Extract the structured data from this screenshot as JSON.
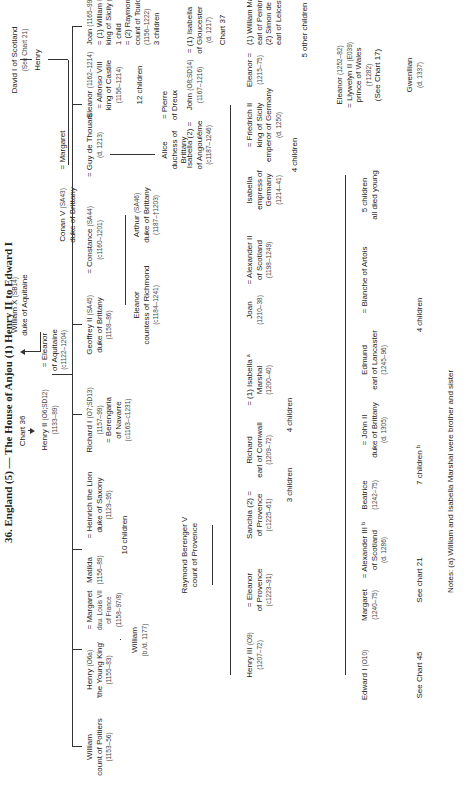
{
  "title": "36. England (5) — The House of Anjou (1) Henry II to Edward I",
  "cross_refs": {
    "chart36": "Chart 36",
    "chart37": "Chart 37",
    "chart21": "See chart 21",
    "chart45": "See Chart 45",
    "chart17": "(See Chart 17)",
    "see_chart21_david": "(See Chart 21)"
  },
  "gen0": {
    "william_x": {
      "name": "William X",
      "ref": "(SB14)",
      "title": "duke of Aquitaine"
    },
    "david_i": {
      "name": "David I of Scotland"
    },
    "henry_scot": {
      "name": "Henry"
    },
    "henry_ii": {
      "name": "Henry II",
      "ref": "(O6;SD12)",
      "dates": "(1133–89)"
    },
    "eleanor_aq": {
      "name": "= Eleanor",
      "title": "of Aquitaine",
      "dates": "(c1122–1204)"
    },
    "conan_iv": {
      "name": "Conan V",
      "ref": "(SA43)",
      "title": "duke of Brittany"
    },
    "margaret_scot": {
      "name": "= Margaret"
    }
  },
  "gen1": [
    {
      "name": "William",
      "title": "count of Poitiers",
      "dates": "(1153–56)"
    },
    {
      "name": "Henry",
      "ref": "(O6a)",
      "title": "'the Young King'",
      "dates": "(1155–83)",
      "spouse": "= Margaret",
      "spouse_title": "dau. Louis VII",
      "spouse_title2": "of France",
      "spouse_dates": "(1158–97/8)",
      "child": "William",
      "child_dates": "(b./d. 1177)"
    },
    {
      "name": "Matilda",
      "dates": "(1156–89)",
      "spouse": "= Heinrich the Lion",
      "spouse_title": "duke of Saxony",
      "spouse_dates": "(1129–95)",
      "children": "10 children"
    },
    {
      "name": "Richard I",
      "ref": "(O7;SD13)",
      "dates": "(1157–99)",
      "spouse": "= Berengaria",
      "spouse_title": "of Navarre",
      "spouse_dates": "(c1163–c1231)"
    },
    {
      "name": "Geoffrey II",
      "ref": "(SA45)",
      "title": "duke of Brittany",
      "dates": "(1158–86)",
      "spouse": "= Constance",
      "spouse_ref": "(SA44)",
      "spouse_dates": "(c1160–1201)",
      "spouse2": "= Guy de Thouars",
      "spouse2_dates": "(d. 1213)"
    },
    {
      "name": "Eleanor",
      "dates": "(1162–1214)",
      "spouse": "= Alfonso VIII",
      "spouse_title": "king of Castile",
      "spouse_dates": "(1156–1214)",
      "children": "12 children"
    },
    {
      "name": "Joan",
      "dates": "(1165–99)",
      "spouse1": "= (1) William II",
      "spouse1_title": "king of Sicily",
      "spouse1_dates": "(1154–89)",
      "child1": "1 child",
      "spouse2": "= (2) Raymond VI",
      "spouse2_title": "count of Toulouse",
      "spouse2_dates": "(1156–1222)",
      "children2": "3 children"
    },
    {
      "name": "John",
      "ref": "(O8;SD14)",
      "dates": "(1167–1216)",
      "spouse1": "= (1) Isabella",
      "spouse1_title": "of Gloucester",
      "spouse1_dates": "(d. 1217)",
      "spouse2": "Isabella (2) =",
      "spouse2_title": "of Angoulême",
      "spouse2_dates": "(c1187–1246)"
    }
  ],
  "brittany": [
    {
      "name": "Eleanor",
      "title": "countess of Richmond",
      "dates": "(c1184–1241)"
    },
    {
      "name": "Arthur",
      "ref": "(SA46)",
      "title": "duke of Brittany",
      "dates": "(1187–†1203)"
    },
    {
      "name": "Alice",
      "title": "duchess of",
      "title2": "Brittany",
      "spouse": "= Pierre",
      "spouse_title": "of Dreux"
    }
  ],
  "provence": {
    "name": "Raymond Berenger V",
    "title": "count of Provence"
  },
  "gen2": [
    {
      "name": "Henry III",
      "ref": "(O9)",
      "dates": "(1207–72)",
      "spouse": "= Eleanor",
      "spouse_title": "of Provence",
      "spouse_dates": "(c1223–91)"
    },
    {
      "name": "Sanchia (2) =",
      "title": "of Provence",
      "dates": "(c1225–61)",
      "children": "3 children"
    },
    {
      "name": "Richard",
      "title": "earl of Cornwall",
      "dates": "(1209–72)",
      "spouse": "= (1) Isabella ᵃ",
      "spouse_title": "Marshal",
      "spouse_dates": "(1200–40)",
      "children": "4 children"
    },
    {
      "name": "Joan",
      "dates": "(1210–38)",
      "spouse": "= Alexander II",
      "spouse_title": "of Scotland",
      "spouse_dates": "(1198–1249)"
    },
    {
      "name": "Isabella",
      "title": "empress of",
      "title2": "Germany",
      "dates": "(1214–41)",
      "spouse": "= Friedrich II",
      "spouse_title": "king of Sicily",
      "spouse_title2": "emperor of Germany",
      "spouse_dates": "(d. 1250)",
      "children": "4 children"
    },
    {
      "name": "Eleanor =",
      "dates": "(1215–75)",
      "spouse1": "(1) William Marshal ᵃ",
      "spouse1_title": "earl of Pembroke (d. 1231)",
      "spouse2": "(2) Simon de Montfort",
      "spouse2_title": "earl of Leicester (†1265)",
      "other": "5 other children"
    }
  ],
  "gen3": [
    {
      "name": "Edward I",
      "ref": "(O10)"
    },
    {
      "name": "Margaret",
      "dates": "(1240–75)",
      "spouse": "= Alexander III ᵇ",
      "spouse_title": "of Scotland",
      "spouse_dates": "(d. 1286)"
    },
    {
      "name": "Beatrice",
      "dates": "(1242–75)",
      "spouse": "= John II",
      "spouse_title": "duke of Brittany",
      "spouse_dates": "(d. 1305)",
      "children": "7 children ᵇ"
    },
    {
      "name": "Edmund",
      "title": "earl of Lancaster",
      "dates": "(1245–96)",
      "spouse": "= Blanche of Artois",
      "children": "4 children"
    },
    {
      "name": "5 children",
      "title": "all died young"
    },
    {
      "name": "Eleanor",
      "dates": "(1252–82)",
      "spouse": "= Llywelyn II",
      "spouse_ref": "(E039)",
      "spouse_title": "prince of Wales",
      "spouse_dates": "(†1282)",
      "child": "Gwenllian",
      "child_dates": "(d. 1337)"
    }
  ],
  "notes": "Notes: (a) William and Isabella Marshal were brother and sister"
}
